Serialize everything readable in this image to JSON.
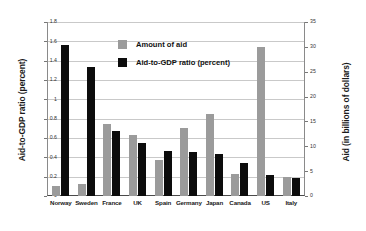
{
  "chart_data": {
    "type": "bar",
    "title": "",
    "xlabel": "",
    "categories": [
      "Norway",
      "Sweden",
      "France",
      "UK",
      "Spain",
      "Germany",
      "Japan",
      "Canada",
      "US",
      "Italy"
    ],
    "series": [
      {
        "name": "Amount of aid",
        "axis": "right",
        "unit": "billions of dollars",
        "color": "#9b9b9b",
        "values": [
          2.0,
          2.4,
          14.5,
          12.3,
          7.2,
          13.7,
          16.5,
          4.5,
          30.0,
          3.9
        ]
      },
      {
        "name": "Aid-to-GDP ratio (percent)",
        "axis": "left",
        "unit": "percent",
        "color": "#0c0c0c",
        "values": [
          1.56,
          1.33,
          0.67,
          0.55,
          0.47,
          0.46,
          0.43,
          0.34,
          0.22,
          0.19
        ]
      }
    ],
    "left_axis": {
      "label": "Aid-to-GDP ratio (percent)",
      "ticks": [
        "0",
        "0.2",
        "0.4",
        "0.6",
        "0.8",
        "1",
        "1.2",
        "1.4",
        "1.6",
        "1.8"
      ],
      "min": 0,
      "max": 1.8
    },
    "right_axis": {
      "label": "Aid (in billions of dollars)",
      "ticks": [
        "0",
        "5",
        "10",
        "15",
        "20",
        "25",
        "30",
        "35"
      ],
      "min": 0,
      "max": 35
    },
    "legend": {
      "position": "inside-top-center",
      "entries": [
        {
          "label": "Amount of aid",
          "color": "#9b9b9b"
        },
        {
          "label": "Aid-to-GDP ratio (percent)",
          "color": "#0c0c0c"
        }
      ]
    },
    "grid": true
  }
}
